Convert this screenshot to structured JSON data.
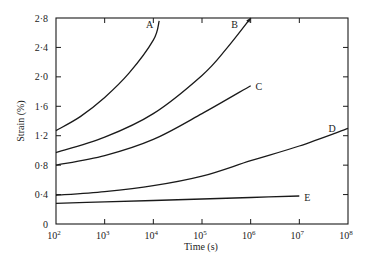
{
  "chart_data": {
    "type": "line",
    "title": "",
    "xlabel": "Time (s)",
    "ylabel": "Strain (%)",
    "xscale": "log",
    "xlim": [
      100,
      100000000
    ],
    "ylim": [
      0,
      2.8
    ],
    "grid": false,
    "legend": "inline curve labels",
    "x_ticks": [
      {
        "value": 100,
        "base": "10",
        "exp": "2"
      },
      {
        "value": 1000,
        "base": "10",
        "exp": "3"
      },
      {
        "value": 10000,
        "base": "10",
        "exp": "4"
      },
      {
        "value": 100000,
        "base": "10",
        "exp": "5"
      },
      {
        "value": 1000000,
        "base": "10",
        "exp": "6"
      },
      {
        "value": 10000000,
        "base": "10",
        "exp": "7"
      },
      {
        "value": 100000000,
        "base": "10",
        "exp": "8"
      }
    ],
    "y_ticks": [
      {
        "value": 0,
        "label": "0"
      },
      {
        "value": 0.4,
        "label": "0·4"
      },
      {
        "value": 0.8,
        "label": "0·8"
      },
      {
        "value": 1.2,
        "label": "1·2"
      },
      {
        "value": 1.6,
        "label": "1·6"
      },
      {
        "value": 2.0,
        "label": "2·0"
      },
      {
        "value": 2.4,
        "label": "2·4"
      },
      {
        "value": 2.8,
        "label": "2·8"
      }
    ],
    "series": [
      {
        "name": "A",
        "log10_x": [
          2,
          2.5,
          3,
          3.5,
          4,
          4.12
        ],
        "values": [
          1.27,
          1.46,
          1.72,
          2.05,
          2.5,
          2.76
        ],
        "label_pos": [
          3.85,
          2.72
        ],
        "arrow": false
      },
      {
        "name": "B",
        "log10_x": [
          2,
          3,
          4,
          5,
          5.5,
          6
        ],
        "values": [
          0.97,
          1.18,
          1.5,
          2.02,
          2.38,
          2.8
        ],
        "label_pos": [
          5.6,
          2.72
        ],
        "arrow": true
      },
      {
        "name": "C",
        "log10_x": [
          2,
          3,
          4,
          5,
          6
        ],
        "values": [
          0.8,
          0.93,
          1.15,
          1.5,
          1.88
        ],
        "label_pos": [
          6.1,
          1.88
        ],
        "arrow": false
      },
      {
        "name": "D",
        "log10_x": [
          2,
          3,
          4,
          5,
          6,
          7,
          8
        ],
        "values": [
          0.39,
          0.44,
          0.52,
          0.65,
          0.86,
          1.06,
          1.3
        ],
        "label_pos": [
          7.6,
          1.3
        ],
        "arrow": false
      },
      {
        "name": "E",
        "log10_x": [
          2,
          3,
          4,
          5,
          6,
          7
        ],
        "values": [
          0.28,
          0.3,
          0.32,
          0.34,
          0.36,
          0.38
        ],
        "label_pos": [
          7.1,
          0.37
        ],
        "arrow": false
      }
    ]
  }
}
